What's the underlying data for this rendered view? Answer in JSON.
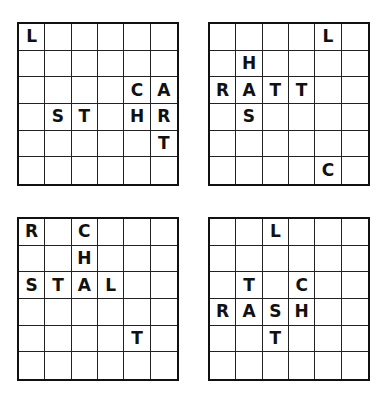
{
  "puzzle": {
    "grid_size": 6,
    "grids": [
      {
        "id": "grid-1",
        "position": "top-left",
        "letters": [
          {
            "row": 0,
            "col": 0,
            "char": "L"
          },
          {
            "row": 2,
            "col": 4,
            "char": "C"
          },
          {
            "row": 2,
            "col": 5,
            "char": "A"
          },
          {
            "row": 3,
            "col": 1,
            "char": "S"
          },
          {
            "row": 3,
            "col": 2,
            "char": "T"
          },
          {
            "row": 3,
            "col": 4,
            "char": "H"
          },
          {
            "row": 3,
            "col": 5,
            "char": "R"
          },
          {
            "row": 4,
            "col": 5,
            "char": "T"
          }
        ]
      },
      {
        "id": "grid-2",
        "position": "top-right",
        "letters": [
          {
            "row": 0,
            "col": 4,
            "char": "L"
          },
          {
            "row": 1,
            "col": 1,
            "char": "H"
          },
          {
            "row": 2,
            "col": 0,
            "char": "R"
          },
          {
            "row": 2,
            "col": 1,
            "char": "A"
          },
          {
            "row": 2,
            "col": 2,
            "char": "T"
          },
          {
            "row": 2,
            "col": 3,
            "char": "T"
          },
          {
            "row": 3,
            "col": 1,
            "char": "S"
          },
          {
            "row": 5,
            "col": 4,
            "char": "C"
          }
        ]
      },
      {
        "id": "grid-3",
        "position": "bottom-left",
        "letters": [
          {
            "row": 0,
            "col": 0,
            "char": "R"
          },
          {
            "row": 0,
            "col": 2,
            "char": "C"
          },
          {
            "row": 1,
            "col": 2,
            "char": "H"
          },
          {
            "row": 2,
            "col": 0,
            "char": "S"
          },
          {
            "row": 2,
            "col": 1,
            "char": "T"
          },
          {
            "row": 2,
            "col": 2,
            "char": "A"
          },
          {
            "row": 2,
            "col": 3,
            "char": "L"
          },
          {
            "row": 4,
            "col": 4,
            "char": "T"
          }
        ]
      },
      {
        "id": "grid-4",
        "position": "bottom-right",
        "letters": [
          {
            "row": 0,
            "col": 2,
            "char": "L"
          },
          {
            "row": 2,
            "col": 1,
            "char": "T"
          },
          {
            "row": 2,
            "col": 3,
            "char": "C"
          },
          {
            "row": 3,
            "col": 0,
            "char": "R"
          },
          {
            "row": 3,
            "col": 1,
            "char": "A"
          },
          {
            "row": 3,
            "col": 2,
            "char": "S"
          },
          {
            "row": 3,
            "col": 3,
            "char": "H"
          },
          {
            "row": 4,
            "col": 2,
            "char": "T"
          }
        ]
      }
    ]
  }
}
